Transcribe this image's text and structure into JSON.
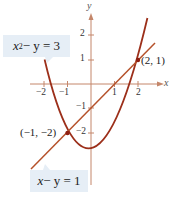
{
  "diagram": {
    "axes": {
      "x_label": "x",
      "y_label": "y",
      "x_ticks": [
        "−2",
        "−1",
        "1",
        "2"
      ],
      "y_ticks": [
        "2",
        "1",
        "−1",
        "−2"
      ]
    },
    "curves": [
      {
        "name": "parabola",
        "equation_lhs": "x² − y = 3",
        "color": "#a0341e"
      },
      {
        "name": "line",
        "equation_lhs": "x − y = 1",
        "color": "#b5512a"
      }
    ],
    "labels": {
      "parabola_eq": {
        "x": "x",
        "sup": "2",
        "rest": " − y = 3"
      },
      "line_eq": {
        "x": "x",
        "rest": " − y = 1"
      }
    },
    "points": [
      {
        "label": "(2, 1)",
        "x": 2,
        "y": 1
      },
      {
        "label": "(−1, −2)",
        "x": -1,
        "y": -2
      }
    ],
    "colors": {
      "axis": "#c07a5a",
      "curve": "#a0341e",
      "label_bg": "#e6eef6"
    }
  }
}
